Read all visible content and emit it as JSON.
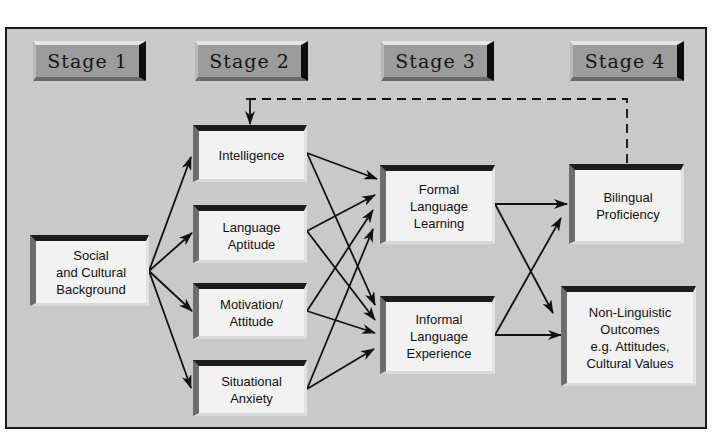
{
  "stages": [
    {
      "label": "Stage 1"
    },
    {
      "label": "Stage 2"
    },
    {
      "label": "Stage 3"
    },
    {
      "label": "Stage 4"
    }
  ],
  "nodes": {
    "social": "Social\nand Cultural\nBackground",
    "intelligence": "Intelligence",
    "aptitude": "Language\nAptitude",
    "motivation": "Motivation/\nAttitude",
    "anxiety": "Situational\nAnxiety",
    "formal": "Formal\nLanguage\nLearning",
    "informal": "Informal\nLanguage\nExperience",
    "bilingual": "Bilingual\nProficiency",
    "nonlinguistic": "Non-Linguistic\nOutcomes\ne.g. Attitudes,\nCultural Values"
  },
  "edges": [
    {
      "from": "social",
      "to": "intelligence"
    },
    {
      "from": "social",
      "to": "aptitude"
    },
    {
      "from": "social",
      "to": "motivation"
    },
    {
      "from": "social",
      "to": "anxiety"
    },
    {
      "from": "intelligence",
      "to": "formal"
    },
    {
      "from": "intelligence",
      "to": "informal"
    },
    {
      "from": "aptitude",
      "to": "formal"
    },
    {
      "from": "aptitude",
      "to": "informal"
    },
    {
      "from": "motivation",
      "to": "formal"
    },
    {
      "from": "motivation",
      "to": "informal"
    },
    {
      "from": "anxiety",
      "to": "formal"
    },
    {
      "from": "anxiety",
      "to": "informal"
    },
    {
      "from": "formal",
      "to": "bilingual"
    },
    {
      "from": "formal",
      "to": "nonlinguistic"
    },
    {
      "from": "informal",
      "to": "bilingual"
    },
    {
      "from": "informal",
      "to": "nonlinguistic"
    },
    {
      "from": "bilingual",
      "to": "intelligence",
      "style": "dashed",
      "type": "feedback"
    }
  ],
  "colors": {
    "background": "#c9c9c9",
    "box_face": "#f2f2f2",
    "stage_face": "#9c9c9c",
    "line": "#111111"
  }
}
